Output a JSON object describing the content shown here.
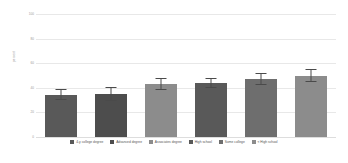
{
  "chart_data": {
    "type": "bar",
    "title": "",
    "xlabel": "",
    "ylabel": "percent",
    "ylim": [
      0,
      100
    ],
    "grid": true,
    "legend_position": "bottom",
    "categories": [
      "4-y college degree",
      "Advanced degree",
      "Associates degree",
      "High school",
      "Some college",
      "< High school"
    ],
    "values": [
      34,
      35,
      43,
      44,
      47,
      50
    ],
    "errors_upper": [
      5,
      6,
      5,
      4,
      5,
      5
    ],
    "errors_lower": [
      4,
      6,
      5,
      4,
      5,
      5
    ],
    "colors": [
      "#595959",
      "#4d4d4d",
      "#8c8c8c",
      "#595959",
      "#6e6e6e",
      "#8c8c8c"
    ],
    "yticks": [
      {
        "value": 100,
        "label": "100"
      },
      {
        "value": 80,
        "label": "80"
      },
      {
        "value": 60,
        "label": "60"
      },
      {
        "value": 40,
        "label": "40"
      },
      {
        "value": 20,
        "label": "20"
      },
      {
        "value": 0,
        "label": "0"
      }
    ],
    "error_bar_color": "#4a4a4a",
    "gridline_color": "#e8e8e8",
    "background_color": "#ffffff"
  }
}
